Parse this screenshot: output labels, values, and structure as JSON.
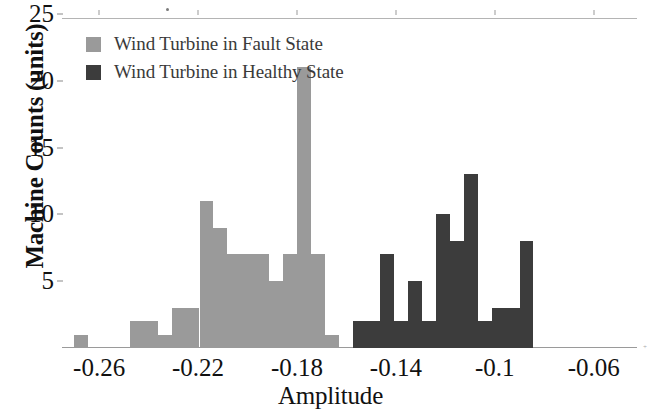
{
  "chart_data": {
    "type": "bar",
    "title": "",
    "subtitle": "",
    "xlabel": "Amplitude",
    "ylabel": "Machine Counts (units)",
    "xlim": [
      -0.275,
      -0.0425
    ],
    "ylim": [
      0,
      25
    ],
    "grid": false,
    "legend_position": "top-left",
    "xticks": [
      -0.26,
      -0.22,
      -0.18,
      -0.14,
      -0.1,
      -0.06
    ],
    "xtick_labels": [
      "-0.26",
      "-0.22",
      "-0.18",
      "-0.14",
      "-0.1",
      "-0.06"
    ],
    "yticks": [
      5,
      10,
      15,
      20,
      25
    ],
    "ytick_labels": [
      "5",
      "10",
      "15",
      "20",
      "25"
    ],
    "bin_width": 0.00563,
    "series": [
      {
        "name": "Wind Turbine in Fault State",
        "color": "#9a9a9a",
        "bin_starts": [
          -0.27,
          -0.2644,
          -0.2588,
          -0.2531,
          -0.2475,
          -0.2419,
          -0.2363,
          -0.2306,
          -0.225,
          -0.2194,
          -0.2138,
          -0.2081,
          -0.2025,
          -0.1969,
          -0.1913,
          -0.1856,
          -0.18,
          -0.1744,
          -0.1688,
          -0.1631,
          -0.1575,
          -0.1519,
          -0.1463,
          -0.1406,
          -0.135,
          -0.1294
        ],
        "values": [
          1,
          0,
          0,
          0,
          2,
          2,
          1,
          3,
          3,
          11,
          9,
          7,
          7,
          7,
          5,
          7,
          21,
          7,
          1
        ]
      },
      {
        "name": "Wind Turbine in Healthy State",
        "color": "#3c3c3c",
        "bin_starts": [
          -0.1238,
          -0.1181,
          -0.1125,
          -0.1069,
          -0.1013,
          -0.0956,
          -0.09,
          -0.0844,
          -0.0788,
          -0.0731,
          -0.0675,
          -0.0619,
          -0.0563
        ],
        "values": [
          2,
          2,
          7,
          2,
          5,
          2,
          10,
          8,
          13,
          2,
          3,
          3,
          8
        ]
      }
    ],
    "bars": [
      {
        "series": "fault",
        "x0": -0.27,
        "x1": -0.2644,
        "value": 1
      },
      {
        "series": "fault",
        "x0": -0.2475,
        "x1": -0.2419,
        "value": 2
      },
      {
        "series": "fault",
        "x0": -0.2419,
        "x1": -0.2363,
        "value": 2
      },
      {
        "series": "fault",
        "x0": -0.2363,
        "x1": -0.2306,
        "value": 1
      },
      {
        "series": "fault",
        "x0": -0.2306,
        "x1": -0.225,
        "value": 3
      },
      {
        "series": "fault",
        "x0": -0.225,
        "x1": -0.2194,
        "value": 3
      },
      {
        "series": "fault",
        "x0": -0.2194,
        "x1": -0.2138,
        "value": 11
      },
      {
        "series": "fault",
        "x0": -0.2138,
        "x1": -0.2081,
        "value": 9
      },
      {
        "series": "fault",
        "x0": -0.2081,
        "x1": -0.2025,
        "value": 7
      },
      {
        "series": "fault",
        "x0": -0.2025,
        "x1": -0.1969,
        "value": 7
      },
      {
        "series": "fault",
        "x0": -0.1969,
        "x1": -0.1913,
        "value": 7
      },
      {
        "series": "fault",
        "x0": -0.1913,
        "x1": -0.1856,
        "value": 5
      },
      {
        "series": "fault",
        "x0": -0.1856,
        "x1": -0.18,
        "value": 7
      },
      {
        "series": "fault",
        "x0": -0.18,
        "x1": -0.1744,
        "value": 21
      },
      {
        "series": "fault",
        "x0": -0.1744,
        "x1": -0.1688,
        "value": 7
      },
      {
        "series": "fault",
        "x0": -0.1688,
        "x1": -0.1631,
        "value": 1
      },
      {
        "series": "healthy",
        "x0": -0.1575,
        "x1": -0.1519,
        "value": 2
      },
      {
        "series": "healthy",
        "x0": -0.1519,
        "x1": -0.1463,
        "value": 2
      },
      {
        "series": "healthy",
        "x0": -0.1463,
        "x1": -0.1406,
        "value": 7
      },
      {
        "series": "healthy",
        "x0": -0.1406,
        "x1": -0.135,
        "value": 2
      },
      {
        "series": "healthy",
        "x0": -0.135,
        "x1": -0.1294,
        "value": 5
      },
      {
        "series": "healthy",
        "x0": -0.1294,
        "x1": -0.1238,
        "value": 2
      },
      {
        "series": "healthy",
        "x0": -0.1238,
        "x1": -0.1181,
        "value": 10
      },
      {
        "series": "healthy",
        "x0": -0.1181,
        "x1": -0.1125,
        "value": 8
      },
      {
        "series": "healthy",
        "x0": -0.1125,
        "x1": -0.1069,
        "value": 13
      },
      {
        "series": "healthy",
        "x0": -0.1069,
        "x1": -0.1013,
        "value": 2
      },
      {
        "series": "healthy",
        "x0": -0.1013,
        "x1": -0.0956,
        "value": 3
      },
      {
        "series": "healthy",
        "x0": -0.0956,
        "x1": -0.09,
        "value": 3
      },
      {
        "series": "healthy",
        "x0": -0.09,
        "x1": -0.0844,
        "value": 8
      }
    ]
  },
  "legend": {
    "items": [
      {
        "label": "Wind Turbine in Fault State",
        "color": "#9a9a9a"
      },
      {
        "label": "Wind Turbine in Healthy State",
        "color": "#3c3c3c"
      }
    ]
  },
  "axes": {
    "x_title": "Amplitude",
    "y_title": "Machine Counts (units)"
  },
  "artifacts": {
    "corner_mark": "+"
  }
}
